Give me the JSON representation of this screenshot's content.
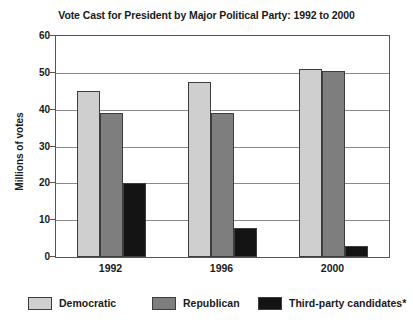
{
  "chart_data": {
    "type": "bar",
    "title": "Vote Cast for President by Major Political Party: 1992 to 2000",
    "xlabel": "",
    "ylabel": "Millions of votes",
    "categories": [
      "1992",
      "1996",
      "2000"
    ],
    "series": [
      {
        "name": "Democratic",
        "color": "#cfcfcf",
        "values": [
          45,
          47.5,
          51
        ]
      },
      {
        "name": "Republican",
        "color": "#7e7e7e",
        "values": [
          39,
          39,
          50.5
        ]
      },
      {
        "name": "Third-party candidates*",
        "color": "#141414",
        "values": [
          20,
          8,
          3
        ]
      }
    ],
    "ylim": [
      0,
      60
    ],
    "yticks": [
      0,
      10,
      20,
      30,
      40,
      50,
      60
    ],
    "ytick_labels": [
      "0",
      "10",
      "20",
      "30",
      "40",
      "50",
      "60"
    ],
    "grid": true,
    "grid_axis": "y",
    "legend_position": "bottom"
  },
  "legend": {
    "items": [
      {
        "label": "Democratic"
      },
      {
        "label": "Republican"
      },
      {
        "label": "Third-party candidates*"
      }
    ]
  }
}
